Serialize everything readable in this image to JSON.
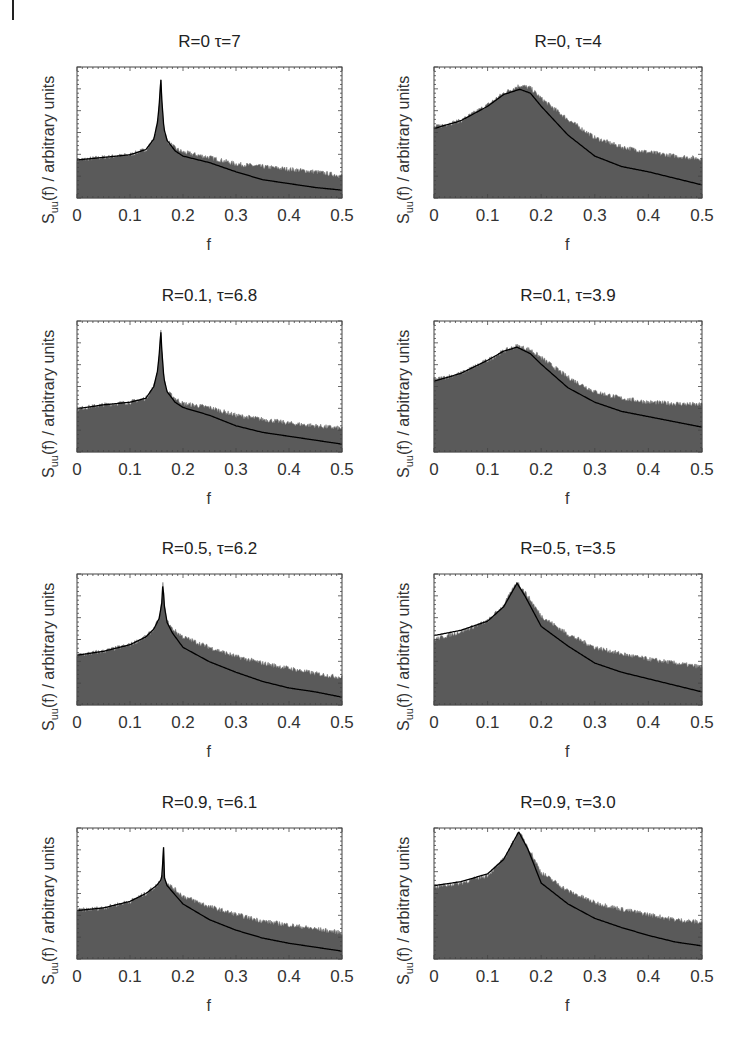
{
  "figure": {
    "ylabel_main": "S",
    "ylabel_sub": "uu",
    "ylabel_rest": "(f) / arbitrary units",
    "xlabel": "f",
    "xticks": [
      "0",
      "0.1",
      "0.2",
      "0.3",
      "0.4",
      "0.5"
    ],
    "colors": {
      "fill": "#5a5a5a",
      "fill_noise": "#7a7a7a",
      "fit_line": "#000000",
      "frame": "#444444"
    }
  },
  "chart_data": [
    {
      "type": "area",
      "title": "R=0 τ=7",
      "xlabel": "f",
      "ylabel": "Suu(f) / arbitrary units",
      "xlim": [
        0,
        0.5
      ],
      "ylim": [
        0,
        1
      ],
      "grid": false,
      "series": [
        {
          "name": "simulated spectrum (filled)",
          "x": [
            0,
            0.05,
            0.1,
            0.13,
            0.145,
            0.152,
            0.156,
            0.158,
            0.16,
            0.164,
            0.17,
            0.185,
            0.2,
            0.25,
            0.3,
            0.35,
            0.4,
            0.45,
            0.5
          ],
          "values": [
            0.29,
            0.31,
            0.33,
            0.37,
            0.45,
            0.58,
            0.75,
            0.93,
            0.75,
            0.53,
            0.44,
            0.38,
            0.35,
            0.31,
            0.26,
            0.24,
            0.22,
            0.2,
            0.17
          ]
        },
        {
          "name": "theory fit (line)",
          "x": [
            0,
            0.05,
            0.1,
            0.13,
            0.145,
            0.152,
            0.156,
            0.158,
            0.16,
            0.164,
            0.17,
            0.185,
            0.2,
            0.25,
            0.3,
            0.35,
            0.4,
            0.45,
            0.5
          ],
          "values": [
            0.29,
            0.31,
            0.33,
            0.37,
            0.45,
            0.58,
            0.75,
            0.93,
            0.75,
            0.53,
            0.44,
            0.36,
            0.32,
            0.27,
            0.2,
            0.14,
            0.11,
            0.08,
            0.06
          ]
        }
      ]
    },
    {
      "type": "area",
      "title": "R=0, τ=4",
      "xlabel": "f",
      "ylabel": "Suu(f) / arbitrary units",
      "xlim": [
        0,
        0.5
      ],
      "ylim": [
        0,
        1
      ],
      "grid": false,
      "series": [
        {
          "name": "simulated spectrum (filled)",
          "x": [
            0,
            0.05,
            0.1,
            0.13,
            0.16,
            0.18,
            0.2,
            0.25,
            0.3,
            0.35,
            0.4,
            0.45,
            0.5
          ],
          "values": [
            0.54,
            0.59,
            0.71,
            0.8,
            0.86,
            0.84,
            0.76,
            0.6,
            0.46,
            0.39,
            0.35,
            0.32,
            0.3
          ]
        },
        {
          "name": "theory fit (line)",
          "x": [
            0,
            0.05,
            0.1,
            0.13,
            0.16,
            0.18,
            0.2,
            0.25,
            0.3,
            0.35,
            0.4,
            0.45,
            0.5
          ],
          "values": [
            0.53,
            0.59,
            0.7,
            0.79,
            0.83,
            0.8,
            0.7,
            0.48,
            0.32,
            0.24,
            0.2,
            0.15,
            0.1
          ]
        }
      ]
    },
    {
      "type": "area",
      "title": "R=0.1, τ=6.8",
      "xlabel": "f",
      "ylabel": "Suu(f) / arbitrary units",
      "xlim": [
        0,
        0.5
      ],
      "ylim": [
        0,
        1
      ],
      "grid": false,
      "series": [
        {
          "name": "simulated spectrum (filled)",
          "x": [
            0,
            0.05,
            0.1,
            0.13,
            0.145,
            0.152,
            0.156,
            0.158,
            0.16,
            0.164,
            0.17,
            0.185,
            0.2,
            0.25,
            0.3,
            0.35,
            0.4,
            0.45,
            0.5
          ],
          "values": [
            0.33,
            0.36,
            0.38,
            0.41,
            0.5,
            0.62,
            0.78,
            0.94,
            0.78,
            0.56,
            0.46,
            0.41,
            0.37,
            0.34,
            0.28,
            0.25,
            0.22,
            0.2,
            0.18
          ]
        },
        {
          "name": "theory fit (line)",
          "x": [
            0,
            0.05,
            0.1,
            0.13,
            0.145,
            0.152,
            0.156,
            0.158,
            0.16,
            0.164,
            0.17,
            0.185,
            0.2,
            0.25,
            0.3,
            0.35,
            0.4,
            0.45,
            0.5
          ],
          "values": [
            0.33,
            0.36,
            0.38,
            0.41,
            0.5,
            0.62,
            0.78,
            0.94,
            0.78,
            0.56,
            0.46,
            0.38,
            0.34,
            0.28,
            0.2,
            0.15,
            0.12,
            0.09,
            0.06
          ]
        }
      ]
    },
    {
      "type": "area",
      "title": "R=0.1, τ=3.9",
      "xlabel": "f",
      "ylabel": "Suu(f) / arbitrary units",
      "xlim": [
        0,
        0.5
      ],
      "ylim": [
        0,
        1
      ],
      "grid": false,
      "series": [
        {
          "name": "simulated spectrum (filled)",
          "x": [
            0,
            0.05,
            0.1,
            0.13,
            0.155,
            0.18,
            0.2,
            0.25,
            0.3,
            0.35,
            0.4,
            0.45,
            0.5
          ],
          "values": [
            0.55,
            0.6,
            0.7,
            0.77,
            0.81,
            0.78,
            0.72,
            0.57,
            0.46,
            0.41,
            0.38,
            0.37,
            0.36
          ]
        },
        {
          "name": "theory fit (line)",
          "x": [
            0,
            0.05,
            0.1,
            0.13,
            0.155,
            0.18,
            0.2,
            0.25,
            0.3,
            0.35,
            0.4,
            0.45,
            0.5
          ],
          "values": [
            0.54,
            0.6,
            0.7,
            0.77,
            0.8,
            0.75,
            0.67,
            0.49,
            0.38,
            0.31,
            0.27,
            0.23,
            0.19
          ]
        }
      ]
    },
    {
      "type": "area",
      "title": "R=0.5, τ=6.2",
      "xlabel": "f",
      "ylabel": "Suu(f) / arbitrary units",
      "xlim": [
        0,
        0.5
      ],
      "ylim": [
        0,
        1
      ],
      "grid": false,
      "series": [
        {
          "name": "simulated spectrum (filled)",
          "x": [
            0,
            0.05,
            0.1,
            0.13,
            0.145,
            0.155,
            0.16,
            0.162,
            0.165,
            0.17,
            0.18,
            0.2,
            0.25,
            0.3,
            0.35,
            0.4,
            0.45,
            0.5
          ],
          "values": [
            0.38,
            0.41,
            0.46,
            0.52,
            0.58,
            0.66,
            0.78,
            0.93,
            0.75,
            0.64,
            0.58,
            0.52,
            0.44,
            0.37,
            0.32,
            0.28,
            0.24,
            0.21
          ]
        },
        {
          "name": "theory fit (line)",
          "x": [
            0,
            0.05,
            0.1,
            0.13,
            0.145,
            0.155,
            0.16,
            0.162,
            0.165,
            0.17,
            0.18,
            0.2,
            0.25,
            0.3,
            0.35,
            0.4,
            0.45,
            0.5
          ],
          "values": [
            0.38,
            0.41,
            0.46,
            0.52,
            0.58,
            0.66,
            0.78,
            0.93,
            0.75,
            0.63,
            0.55,
            0.44,
            0.33,
            0.25,
            0.18,
            0.13,
            0.1,
            0.06
          ]
        }
      ]
    },
    {
      "type": "area",
      "title": "R=0.5, τ=3.5",
      "xlabel": "f",
      "ylabel": "Suu(f) / arbitrary units",
      "xlim": [
        0,
        0.5
      ],
      "ylim": [
        0,
        1
      ],
      "grid": false,
      "series": [
        {
          "name": "simulated spectrum (filled)",
          "x": [
            0,
            0.05,
            0.1,
            0.13,
            0.155,
            0.17,
            0.2,
            0.25,
            0.3,
            0.35,
            0.4,
            0.45,
            0.5
          ],
          "values": [
            0.5,
            0.56,
            0.64,
            0.76,
            0.94,
            0.86,
            0.68,
            0.54,
            0.44,
            0.39,
            0.35,
            0.32,
            0.29
          ]
        },
        {
          "name": "theory fit (line)",
          "x": [
            0,
            0.05,
            0.1,
            0.13,
            0.155,
            0.17,
            0.2,
            0.25,
            0.3,
            0.35,
            0.4,
            0.45,
            0.5
          ],
          "values": [
            0.53,
            0.57,
            0.64,
            0.75,
            0.93,
            0.83,
            0.6,
            0.45,
            0.32,
            0.25,
            0.2,
            0.15,
            0.1
          ]
        }
      ]
    },
    {
      "type": "area",
      "title": "R=0.9, τ=6.1",
      "xlabel": "f",
      "ylabel": "Suu(f) / arbitrary units",
      "xlim": [
        0,
        0.5
      ],
      "ylim": [
        0,
        1
      ],
      "grid": false,
      "series": [
        {
          "name": "simulated spectrum (filled)",
          "x": [
            0,
            0.05,
            0.1,
            0.13,
            0.15,
            0.158,
            0.161,
            0.163,
            0.165,
            0.17,
            0.2,
            0.25,
            0.3,
            0.35,
            0.4,
            0.45,
            0.5
          ],
          "values": [
            0.37,
            0.39,
            0.44,
            0.5,
            0.56,
            0.6,
            0.65,
            0.9,
            0.63,
            0.58,
            0.48,
            0.4,
            0.34,
            0.29,
            0.26,
            0.23,
            0.2
          ]
        },
        {
          "name": "theory fit (line)",
          "x": [
            0,
            0.05,
            0.1,
            0.13,
            0.15,
            0.158,
            0.161,
            0.163,
            0.165,
            0.17,
            0.2,
            0.25,
            0.3,
            0.35,
            0.4,
            0.45,
            0.5
          ],
          "values": [
            0.37,
            0.39,
            0.44,
            0.5,
            0.56,
            0.6,
            0.65,
            0.9,
            0.62,
            0.56,
            0.42,
            0.3,
            0.22,
            0.16,
            0.12,
            0.09,
            0.06
          ]
        }
      ]
    },
    {
      "type": "area",
      "title": "R=0.9, τ=3.0",
      "xlabel": "f",
      "ylabel": "Suu(f) / arbitrary units",
      "xlim": [
        0,
        0.5
      ],
      "ylim": [
        0,
        1
      ],
      "grid": false,
      "series": [
        {
          "name": "simulated spectrum (filled)",
          "x": [
            0,
            0.05,
            0.1,
            0.13,
            0.158,
            0.175,
            0.2,
            0.25,
            0.3,
            0.35,
            0.4,
            0.45,
            0.5
          ],
          "values": [
            0.55,
            0.58,
            0.64,
            0.76,
            0.97,
            0.86,
            0.66,
            0.52,
            0.43,
            0.38,
            0.34,
            0.3,
            0.28
          ]
        },
        {
          "name": "theory fit (line)",
          "x": [
            0,
            0.05,
            0.1,
            0.13,
            0.158,
            0.175,
            0.2,
            0.25,
            0.3,
            0.35,
            0.4,
            0.45,
            0.5
          ],
          "values": [
            0.56,
            0.59,
            0.65,
            0.76,
            0.97,
            0.84,
            0.58,
            0.42,
            0.31,
            0.24,
            0.18,
            0.13,
            0.1
          ]
        }
      ]
    }
  ]
}
